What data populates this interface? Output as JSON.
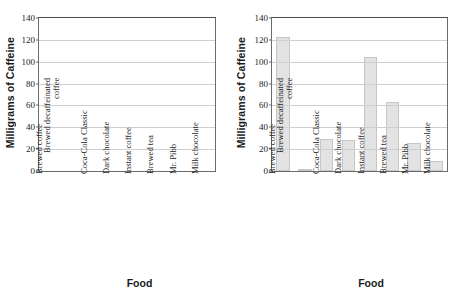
{
  "chart_data": [
    {
      "type": "bar",
      "title": "",
      "xlabel": "Food",
      "ylabel": "Milligrams of Caffeine",
      "ylim": [
        0,
        140
      ],
      "yticks": [
        0,
        20,
        40,
        60,
        80,
        100,
        120,
        140
      ],
      "grid": true,
      "legend": "none",
      "categories": [
        "Brewed coffee",
        "Brewed decaffeinated coffee",
        "Coca-Cola Classic",
        "Dark chocolate",
        "Instant coffee",
        "Brewed tea",
        "Mr. Pibb",
        "Milk chocolate"
      ],
      "values": [
        null,
        null,
        null,
        null,
        null,
        null,
        null,
        null
      ],
      "note": "empty plot frame, no bars drawn"
    },
    {
      "type": "bar",
      "title": "",
      "xlabel": "Food",
      "ylabel": "Milligrams of Caffeine",
      "ylim": [
        0,
        140
      ],
      "yticks": [
        0,
        20,
        40,
        60,
        80,
        100,
        120,
        140
      ],
      "grid": true,
      "legend": "none",
      "categories": [
        "Brewed coffee",
        "Brewed decaffeinated coffee",
        "Coca-Cola Classic",
        "Dark chocolate",
        "Instant coffee",
        "Brewed tea",
        "Mr. Pibb",
        "Milk chocolate"
      ],
      "values": [
        123,
        2,
        29,
        28,
        104,
        63,
        26,
        9
      ],
      "bar_color": "#e3e3e3",
      "bar_border_color": "#c6c6c6"
    }
  ],
  "panels": [
    {
      "id": "left",
      "ylabel": "Milligrams of Caffeine",
      "xlabel": "Food",
      "yticks": [
        "140",
        "120",
        "100",
        "80",
        "60",
        "40",
        "20",
        "0"
      ],
      "categories": [
        "Brewed coffee",
        "Brewed decaffeinated coffee",
        "Coca-Cola Classic",
        "Dark chocolate",
        "Instant coffee",
        "Brewed tea",
        "Mr. Pibb",
        "Milk chocolate"
      ]
    },
    {
      "id": "right",
      "ylabel": "Milligrams of Caffeine",
      "xlabel": "Food",
      "yticks": [
        "140",
        "120",
        "100",
        "80",
        "60",
        "40",
        "20",
        "0"
      ],
      "categories": [
        "Brewed coffee",
        "Brewed decaffeinated coffee",
        "Coca-Cola Classic",
        "Dark chocolate",
        "Instant coffee",
        "Brewed tea",
        "Mr. Pibb",
        "Milk chocolate"
      ]
    }
  ],
  "colors": {
    "bar_fill": "#e3e3e3",
    "bar_stroke": "#c6c6c6",
    "grid": "#cfcfcf",
    "axis": "#6b6b6b",
    "text": "#1a1a1a"
  }
}
